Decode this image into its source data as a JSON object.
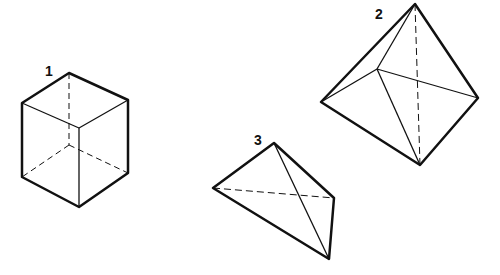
{
  "figure": {
    "shapes": [
      {
        "label": "1",
        "name": "cube"
      },
      {
        "label": "2",
        "name": "octahedron-like bipyramid"
      },
      {
        "label": "3",
        "name": "tetrahedron"
      }
    ]
  }
}
